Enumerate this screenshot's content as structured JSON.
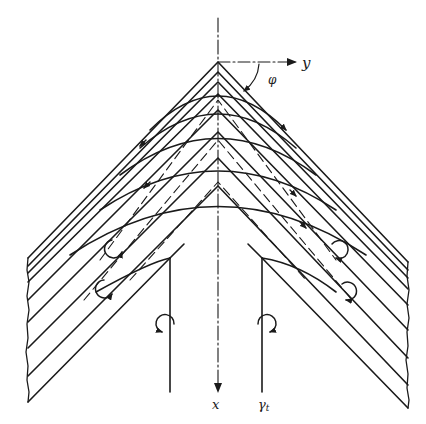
{
  "diagram": {
    "type": "technical-schematic",
    "labels": {
      "x_axis": "x",
      "y_axis": "y",
      "angle": "φ",
      "gamma": "γ",
      "gamma_subscript": "t"
    },
    "colors": {
      "ink": "#1a1a1a",
      "background": "#ffffff"
    },
    "elements": {
      "symmetry_axis": "dash-dot vertical line with arrow pointing down (x)",
      "transverse_axis": "dash-dot horizontal line with arrow pointing right (y)",
      "angle_marker": "arc arrow from y-axis to chevron arm labeled φ",
      "chevron_layers": 8,
      "curved_flow_lines": 6,
      "vortex_symbols": 6,
      "vertical_vortex_lines": 2
    }
  }
}
